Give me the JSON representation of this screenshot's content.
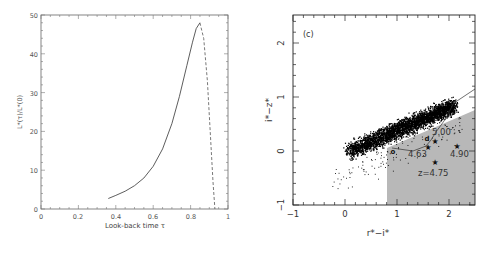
{
  "chart_data": [
    {
      "type": "line",
      "title": "",
      "xlabel": "Look-back time τ",
      "ylabel": "L*(τ)/L*(0)",
      "xlim": [
        0,
        1
      ],
      "ylim": [
        0,
        50
      ],
      "xticks": [
        "0",
        "0.2",
        "0.4",
        "0.6",
        "0.8",
        "1"
      ],
      "yticks": [
        "0",
        "10",
        "20",
        "30",
        "40",
        "50"
      ],
      "grid": false,
      "series": [
        {
          "name": "solid",
          "style": "solid",
          "x": [
            0.36,
            0.4,
            0.45,
            0.5,
            0.55,
            0.6,
            0.65,
            0.7,
            0.74,
            0.78,
            0.81,
            0.83,
            0.85
          ],
          "y": [
            2.7,
            3.5,
            4.6,
            6.0,
            8.0,
            11.0,
            15.5,
            22.0,
            29.0,
            37.0,
            43.0,
            46.5,
            48.0
          ]
        },
        {
          "name": "dashed",
          "style": "dashed",
          "x": [
            0.85,
            0.87,
            0.89,
            0.905,
            0.92,
            0.93
          ],
          "y": [
            48.0,
            44.0,
            33.0,
            20.0,
            7.0,
            0.0
          ]
        }
      ]
    },
    {
      "type": "scatter",
      "panel_label": "(c)",
      "xlabel": "r*−i*",
      "ylabel": "i*−z*",
      "xlim": [
        -1,
        2.5
      ],
      "ylim": [
        -1,
        2.5
      ],
      "xticks": [
        "−1",
        "0",
        "1",
        "2"
      ],
      "yticks": [
        "−1",
        "0",
        "1",
        "2"
      ],
      "grid": false,
      "points_description": "dense cloud of stellar locus points elongated from (0, 0) to (2.2, 0.9)",
      "shaded_region": {
        "x_min": 0.8,
        "boundary": [
          [
            0.8,
            0.05
          ],
          [
            2.5,
            0.75
          ]
        ],
        "color": "#b8b8b8"
      },
      "track_line": [
        [
          0.9,
          0.05
        ],
        [
          1.3,
          0.0
        ],
        [
          1.55,
          0.1
        ],
        [
          1.65,
          0.2
        ],
        [
          1.75,
          0.35
        ],
        [
          1.9,
          0.55
        ],
        [
          2.1,
          0.9
        ],
        [
          2.5,
          1.15
        ]
      ],
      "annotations": [
        {
          "text": "5.00",
          "x": 1.75,
          "y": 0.3
        },
        {
          "text": "4.63",
          "x": 1.5,
          "y": 0.0
        },
        {
          "text": "4.90",
          "x": 2.05,
          "y": 0.0
        },
        {
          "text": "z=4.75",
          "x": 1.45,
          "y": -0.35
        }
      ],
      "stars": [
        [
          1.6,
          0.08
        ],
        [
          1.73,
          0.2
        ],
        [
          1.72,
          -0.18
        ],
        [
          2.15,
          0.1
        ]
      ]
    }
  ],
  "left": {
    "ylabel": "L*(τ)/L*(0)",
    "xlabel": "Look-back time τ",
    "xticks": [
      "0",
      "0.2",
      "0.4",
      "0.6",
      "0.8",
      "1"
    ],
    "yticks": [
      "0",
      "10",
      "20",
      "30",
      "40",
      "50"
    ]
  },
  "right": {
    "panel_label": "(c)",
    "xlabel": "r*−i*",
    "ylabel": "i*−z*",
    "xticks": [
      "−1",
      "0",
      "1",
      "2"
    ],
    "yticks": [
      "−1",
      "0",
      "1",
      "2"
    ],
    "labels": {
      "l500": "5.00",
      "l463": "4.63",
      "l490": "4.90",
      "l475": "z=4.75"
    }
  }
}
